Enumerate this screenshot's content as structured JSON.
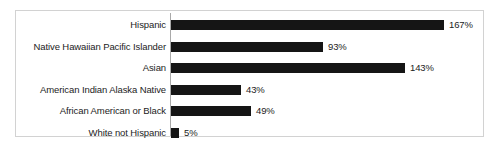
{
  "chart_data": {
    "type": "bar",
    "orientation": "horizontal",
    "title": "",
    "xlabel": "",
    "ylabel": "",
    "grid": false,
    "legend": "none",
    "xlim": [
      0,
      167
    ],
    "categories": [
      "Hispanic",
      "Native Hawaiian Pacific Islander",
      "Asian",
      "American Indian Alaska Native",
      "African American or Black",
      "White not Hispanic"
    ],
    "values": [
      167,
      93,
      143,
      43,
      49,
      5
    ],
    "value_labels": [
      "167%",
      "93%",
      "143%",
      "43%",
      "49%",
      "5%"
    ],
    "bar_color": "#151515",
    "axis_color": "#a9a9a9",
    "frame_color": "#d2d2d2",
    "background": "#ffffff"
  },
  "rows": [
    {
      "label": "Hispanic",
      "value": 167,
      "value_label": "167%"
    },
    {
      "label": "Native Hawaiian Pacific Islander",
      "value": 93,
      "value_label": "93%"
    },
    {
      "label": "Asian",
      "value": 143,
      "value_label": "143%"
    },
    {
      "label": "American Indian Alaska Native",
      "value": 43,
      "value_label": "43%"
    },
    {
      "label": "African American or Black",
      "value": 49,
      "value_label": "49%"
    },
    {
      "label": "White not Hispanic",
      "value": 5,
      "value_label": "5%"
    }
  ],
  "scale": {
    "px_per_percent": 1.635,
    "row_pitch": 21.5,
    "row_top_start": 5,
    "bar_height": 10,
    "value_gap": 5
  }
}
